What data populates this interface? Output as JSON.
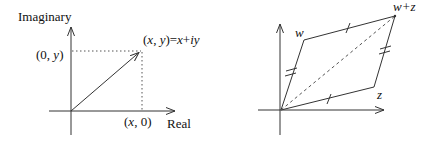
{
  "left_diagram": {
    "title": "Complex number as point in plane",
    "y_axis_label": "Imaginary",
    "x_axis_label": "Real",
    "point_label": "(x, y)=x+iy",
    "y_projection_label": "(0, y)",
    "x_projection_label": "(x, 0)"
  },
  "right_diagram": {
    "title": "Parallelogram rule for addition",
    "vertex_w_label": "w",
    "vertex_z_label": "z",
    "vertex_sum_label": "w+z"
  },
  "colors": {
    "line": "#333333",
    "dotted": "#555555",
    "text": "#111111",
    "background": "#ffffff"
  }
}
